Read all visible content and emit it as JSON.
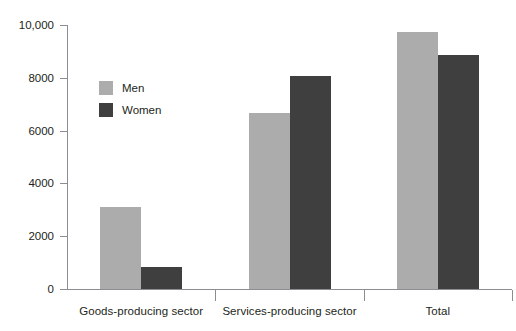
{
  "chart_data": {
    "type": "bar",
    "title": "",
    "subtitle": "",
    "xlabel": "",
    "ylabel": "",
    "categories": [
      "Goods-producing sector",
      "Services-producing sector",
      "Total"
    ],
    "series": [
      {
        "name": "Men",
        "color": "#acacac",
        "values": [
          3100,
          6650,
          9750
        ]
      },
      {
        "name": "Women",
        "color": "#3f3f3f",
        "values": [
          830,
          8050,
          8850
        ]
      }
    ],
    "ylim": [
      0,
      10000
    ],
    "yticks": [
      0,
      2000,
      4000,
      6000,
      8000,
      10000
    ],
    "ytick_labels": [
      "0",
      "2000",
      "4000",
      "6000",
      "8000",
      "10,000"
    ],
    "grid": false,
    "legend_position": "inside-upper-left",
    "legend_entries": [
      "Men",
      "Women"
    ],
    "annotations": []
  },
  "axes": {
    "axis_color": "#8c8c93",
    "tick_label_color": "#231f20"
  }
}
